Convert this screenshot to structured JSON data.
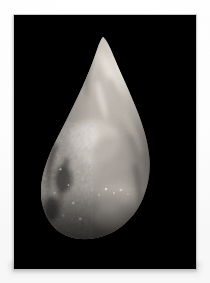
{
  "page": {
    "background_color": "#fcfcfc",
    "width": 210,
    "height": 283
  },
  "photo": {
    "name": "stone-hand-axe-photograph",
    "background_color": "#000000",
    "border_color": "#c9c9c9",
    "frame": {
      "x": 13,
      "y": 14,
      "width": 184,
      "height": 256
    },
    "caption": ""
  },
  "subject": {
    "label": "flint hand axe",
    "description": "Teardrop-shaped bifacial stone tool photographed against a black background",
    "orientation": "tip upward, butt at bottom",
    "lighting": "directional light from upper right",
    "palette": {
      "highlight": "#efeae2",
      "bright": "#d8d3ca",
      "midtone": "#9a948c",
      "shadow": "#4e4a46",
      "deep_shadow": "#201e1d",
      "background": "#000000"
    },
    "geometry": {
      "tip_x": 103,
      "tip_y": 38,
      "widest_y": 192,
      "left_edge_x": 55,
      "right_edge_x": 150,
      "base_y": 248
    }
  }
}
